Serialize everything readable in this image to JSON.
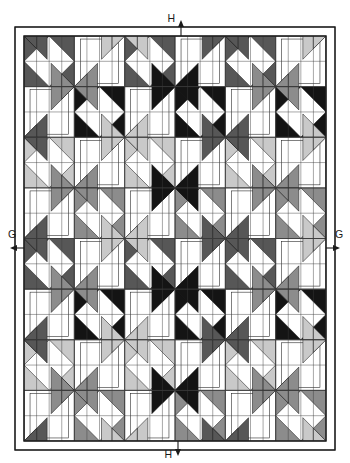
{
  "document": {
    "type": "quilt-assembly-diagram",
    "clipped_caption_text": "strips."
  },
  "labels": {
    "top_marker": "H",
    "bottom_marker": "H",
    "left_marker": "G",
    "right_marker": "G"
  },
  "colors": {
    "background": "#ffffff",
    "outline": "#1a1a1a",
    "grid_line": "#3c3c3c",
    "fabric_white": "#ffffff",
    "fabric_light_gray": "#c9c9c9",
    "fabric_medium_gray": "#8c8c8c",
    "fabric_dark_gray": "#575757",
    "fabric_black": "#141414",
    "border_fill": "#ffffff",
    "caption_text": "#5f5f5f"
  },
  "layout": {
    "canvas_width": 350,
    "canvas_height": 463,
    "quilt_left": 15,
    "quilt_top": 27,
    "quilt_right": 335,
    "quilt_bottom": 450,
    "outer_border_width": 9,
    "block_size": 53.3,
    "blocks_across": 6,
    "blocks_down": 8,
    "units_per_block": 4
  },
  "markers": {
    "top": {
      "letter": "H",
      "x": 175,
      "y": 22,
      "arrow_y_from": 27,
      "arrow_y_to": 36
    },
    "bottom": {
      "letter": "H",
      "x": 175,
      "y": 452,
      "arrow_y_from": 450,
      "arrow_y_to": 441
    },
    "left": {
      "letter": "G",
      "x": 8,
      "y": 238,
      "arrow_x_from": 15,
      "arrow_x_to": 24
    },
    "right": {
      "letter": "G",
      "x": 342,
      "y": 238,
      "arrow_x_from": 335,
      "arrow_x_to": 326
    }
  },
  "chart_data": {
    "type": "table",
    "value_sequence": [
      "dark_gray",
      "black",
      "light_gray",
      "medium_gray",
      "dark_gray",
      "black",
      "light_gray",
      "medium_gray"
    ],
    "value_names": [
      "white",
      "light_gray",
      "medium_gray",
      "dark_gray",
      "black"
    ],
    "value_hexes": [
      "#ffffff",
      "#c9c9c9",
      "#8c8c8c",
      "#575757",
      "#141414"
    ],
    "columns": 6,
    "rows": 8
  }
}
